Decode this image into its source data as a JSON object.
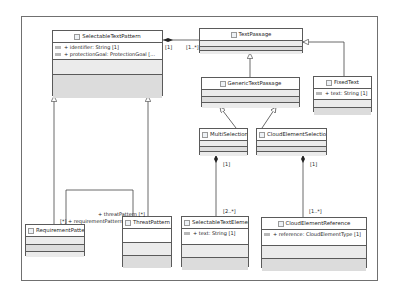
{
  "diagram": {
    "type": "UML class diagram",
    "classes": {
      "selectable_text_pattern": {
        "name": "SelectableTextPattern",
        "attributes": [
          "+ identifier: String [1]",
          "+ protectionGoal: ProtectionGoal [..."
        ]
      },
      "text_passage": {
        "name": "TextPassage",
        "attributes": []
      },
      "generic_text_passage": {
        "name": "GenericTextPassage",
        "attributes": []
      },
      "fixed_text": {
        "name": "FixedText",
        "attributes": [
          "+ text: String [1]"
        ]
      },
      "multi_selection": {
        "name": "MultiSelection",
        "attributes": []
      },
      "cloud_element_selection": {
        "name": "CloudElementSelection",
        "attributes": []
      },
      "requirement_pattern": {
        "name": "RequirementPattern",
        "attributes": []
      },
      "threat_pattern": {
        "name": "ThreatPattern",
        "attributes": []
      },
      "selectable_text_element": {
        "name": "SelectableTextElement",
        "attributes": [
          "+ text: String [1]"
        ]
      },
      "cloud_element_reference": {
        "name": "CloudElementReference",
        "attributes": [
          "+ reference: CloudElementType [1]"
        ]
      }
    },
    "labels": {
      "stp_tp_src": "[1]",
      "stp_tp_dst": "[1..*]",
      "ms_mult": "[1]",
      "ms_ste_mult": "[2..*]",
      "ces_mult": "[1]",
      "ces_cer_mult": "[1..*]",
      "threat_role": "+ threatPattern [*]",
      "req_role": "[*] + requirementPattern"
    }
  }
}
